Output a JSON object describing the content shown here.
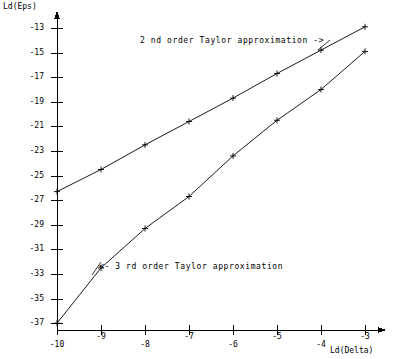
{
  "chart_data": {
    "type": "line",
    "title": "",
    "subtitle": "",
    "xlabel": "Ld(Delta)",
    "ylabel": "Ld(Eps)",
    "xlim": [
      -10,
      -3
    ],
    "ylim": [
      -38,
      -12
    ],
    "grid": false,
    "legend_position": "inline-annotations",
    "x": [
      -10,
      -9,
      -8,
      -7,
      -6,
      -5,
      -4,
      -3
    ],
    "xticks": [
      -10,
      -9,
      -8,
      -7,
      -6,
      -5,
      -4,
      -3
    ],
    "xtick_labels": [
      "-10",
      "-9",
      "-8",
      "-7",
      "-6",
      "-5",
      "-4",
      "-3"
    ],
    "yticks": [
      -13,
      -15,
      -17,
      -19,
      -21,
      -23,
      -25,
      -27,
      -29,
      -31,
      -33,
      -35,
      -37
    ],
    "ytick_labels": [
      "-13",
      "-15",
      "-17",
      "-19",
      "-21",
      "-23",
      "-25",
      "-27",
      "-29",
      "-31",
      "-33",
      "-35",
      "-37"
    ],
    "marker": "plus",
    "series": [
      {
        "name": "2 nd order Taylor approximation",
        "values": [
          -26.3,
          -24.5,
          -22.5,
          -20.6,
          -18.7,
          -16.7,
          -14.8,
          -12.9
        ]
      },
      {
        "name": "3 rd order Taylor approximation",
        "values": [
          -37.0,
          -32.5,
          -29.3,
          -26.7,
          -23.4,
          -20.5,
          -18.0,
          -14.9
        ]
      }
    ],
    "annotations": [
      {
        "text": "2 nd order Taylor approximation ->",
        "target_series": 0
      },
      {
        "text": "<- 3 rd order Taylor approximation",
        "target_series": 1
      }
    ],
    "colors": {
      "line": "#000000",
      "axis": "#000000",
      "background": "#ffffff"
    }
  },
  "axes": {
    "y_title": "Ld(Eps)",
    "x_title": "Ld(Delta)"
  }
}
